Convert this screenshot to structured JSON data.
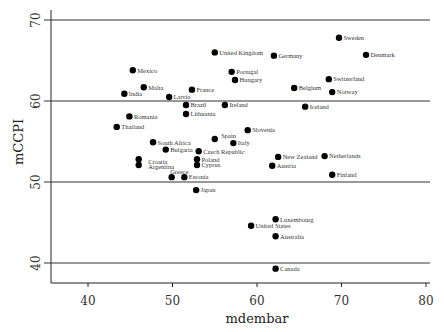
{
  "chart_data": {
    "type": "scatter",
    "title": "",
    "xlabel": "mdembar",
    "ylabel": "mCCPI",
    "xlim": [
      35.6,
      80.8
    ],
    "ylim": [
      36.2,
      71.2
    ],
    "xticks": [
      40,
      50,
      60,
      70,
      80
    ],
    "yticks": [
      40,
      50,
      60,
      70
    ],
    "grid": "horizontal lines at y ticks",
    "legend": null,
    "points": [
      {
        "label": "Sweden",
        "x": 69.7,
        "y": 67.8
      },
      {
        "label": "Denmark",
        "x": 72.9,
        "y": 65.7
      },
      {
        "label": "United Kingdom",
        "x": 55.0,
        "y": 66.0
      },
      {
        "label": "Germany",
        "x": 62.0,
        "y": 65.6
      },
      {
        "label": "Portugal",
        "x": 57.0,
        "y": 63.6
      },
      {
        "label": "Hungary",
        "x": 57.4,
        "y": 62.6
      },
      {
        "label": "Switzerland",
        "x": 68.5,
        "y": 62.7
      },
      {
        "label": "Belgium",
        "x": 64.4,
        "y": 61.6
      },
      {
        "label": "Norway",
        "x": 68.9,
        "y": 61.1
      },
      {
        "label": "Mexico",
        "x": 45.3,
        "y": 63.8
      },
      {
        "label": "Malta",
        "x": 46.6,
        "y": 61.7
      },
      {
        "label": "India",
        "x": 44.3,
        "y": 60.9
      },
      {
        "label": "Latvia",
        "x": 49.6,
        "y": 60.5
      },
      {
        "label": "France",
        "x": 52.3,
        "y": 61.4
      },
      {
        "label": "Brazil",
        "x": 51.6,
        "y": 59.5
      },
      {
        "label": "Ireland",
        "x": 56.2,
        "y": 59.5
      },
      {
        "label": "Iceland",
        "x": 65.7,
        "y": 59.3
      },
      {
        "label": "Lithuania",
        "x": 51.6,
        "y": 58.4
      },
      {
        "label": "Romania",
        "x": 44.9,
        "y": 58.1
      },
      {
        "label": "Thailand",
        "x": 43.4,
        "y": 56.8
      },
      {
        "label": "Slovenia",
        "x": 58.9,
        "y": 56.4
      },
      {
        "label": "South Africa",
        "x": 47.7,
        "y": 54.9
      },
      {
        "label": "Spain",
        "x": 55.0,
        "y": 55.3
      },
      {
        "label": "Italy",
        "x": 57.2,
        "y": 54.8
      },
      {
        "label": "Bulgaria",
        "x": 49.2,
        "y": 54.0
      },
      {
        "label": "Czech Republic",
        "x": 53.1,
        "y": 53.8
      },
      {
        "label": "Croatia",
        "x": 46.0,
        "y": 52.8
      },
      {
        "label": "Argentina",
        "x": 46.0,
        "y": 52.1
      },
      {
        "label": "Poland",
        "x": 52.9,
        "y": 52.8
      },
      {
        "label": "Cyprus",
        "x": 52.9,
        "y": 52.1
      },
      {
        "label": "New Zealand",
        "x": 62.5,
        "y": 53.1
      },
      {
        "label": "Netherlands",
        "x": 68.0,
        "y": 53.2
      },
      {
        "label": "Austria",
        "x": 61.8,
        "y": 52.0
      },
      {
        "label": "Finland",
        "x": 68.9,
        "y": 50.9
      },
      {
        "label": "Greece",
        "x": 49.9,
        "y": 50.6
      },
      {
        "label": "Estonia",
        "x": 51.4,
        "y": 50.6
      },
      {
        "label": "Japan",
        "x": 52.8,
        "y": 49.0
      },
      {
        "label": "Luxembourg",
        "x": 62.2,
        "y": 45.4
      },
      {
        "label": "United States",
        "x": 59.3,
        "y": 44.6
      },
      {
        "label": "Australia",
        "x": 62.2,
        "y": 43.3
      },
      {
        "label": "Canada",
        "x": 62.2,
        "y": 39.3
      }
    ]
  },
  "layout": {
    "label_offsets": {
      "Greece": [
        -6,
        -5
      ],
      "Spain": [
        2,
        -3
      ],
      "Croatia": [
        5,
        2
      ],
      "Argentina": [
        5,
        2
      ]
    },
    "colors": {
      "point": "#000000",
      "gridline": "#333333",
      "axis": "#222222"
    }
  }
}
